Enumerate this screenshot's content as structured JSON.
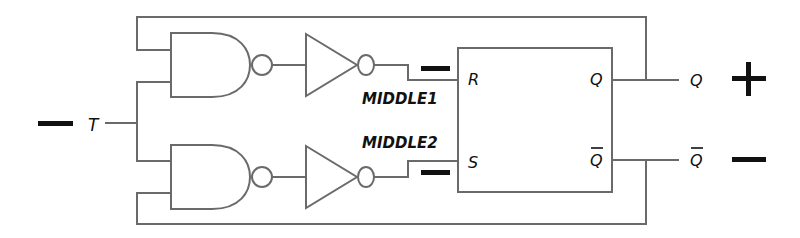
{
  "diagram": {
    "type": "logic-circuit",
    "input": {
      "name": "T",
      "polarity_sign": "−"
    },
    "nodes": {
      "middle1": {
        "label": "MIDDLE1",
        "polarity_sign": "−"
      },
      "middle2": {
        "label": "MIDDLE2",
        "polarity_sign": "−"
      }
    },
    "flipflop": {
      "inputs": {
        "r": "R",
        "s": "S"
      },
      "outputs": {
        "q": "Q",
        "qbar": "Q"
      }
    },
    "outputs": {
      "q": {
        "label": "Q",
        "polarity_sign": "+"
      },
      "qbar": {
        "label": "Q",
        "polarity_sign": "−"
      }
    },
    "gates": [
      {
        "id": "nand-top",
        "type": "NAND"
      },
      {
        "id": "inv-top",
        "type": "NOT"
      },
      {
        "id": "nand-bottom",
        "type": "NAND"
      },
      {
        "id": "inv-bottom",
        "type": "NOT"
      }
    ]
  }
}
